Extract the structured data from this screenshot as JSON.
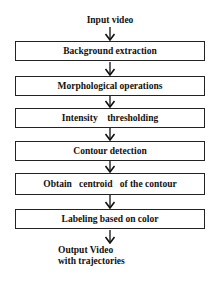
{
  "diagram": {
    "type": "flowchart",
    "input_label": "Input video",
    "steps": [
      {
        "label": "Background extraction"
      },
      {
        "label": "Morphological operations"
      },
      {
        "label": "Intensity    thresholding"
      },
      {
        "label": "Contour detection"
      },
      {
        "label": "Obtain   centroid   of the contour"
      },
      {
        "label": "Labeling based on color"
      }
    ],
    "output_label_line1": "Output Video",
    "output_label_line2": "with trajectories"
  }
}
